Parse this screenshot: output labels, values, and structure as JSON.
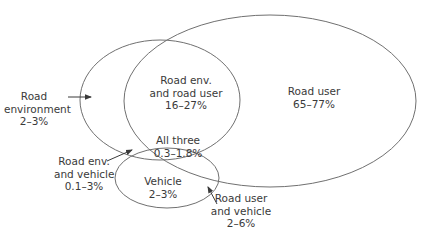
{
  "diagram": {
    "type": "venn",
    "stroke_color": "#707070",
    "text_color": "#3a3a3a",
    "sets": [
      {
        "id": "road_environment",
        "cx": 160,
        "cy": 100,
        "rx": 80,
        "ry": 60
      },
      {
        "id": "road_user",
        "cx": 270,
        "cy": 101,
        "rx": 146,
        "ry": 86
      },
      {
        "id": "vehicle",
        "cx": 167,
        "cy": 178,
        "rx": 52,
        "ry": 30
      }
    ],
    "labels": {
      "road_environment": {
        "line1": "Road",
        "line2": "environment",
        "line3": "2–3%"
      },
      "road_env_and_road_user": {
        "line1": "Road env.",
        "line2": "and road user",
        "line3": "16–27%"
      },
      "road_user": {
        "line1": "Road user",
        "line2": "65–77%"
      },
      "all_three": {
        "line1": "All three",
        "line2": "0.3–1.8%"
      },
      "road_env_and_vehicle": {
        "line1": "Road env.",
        "line2": "and vehicle",
        "line3": "0.1–3%"
      },
      "vehicle": {
        "line1": "Vehicle",
        "line2": "2–3%"
      },
      "road_user_and_vehicle": {
        "line1": "Road user",
        "line2": "and vehicle",
        "line3": "2–6%"
      }
    }
  }
}
